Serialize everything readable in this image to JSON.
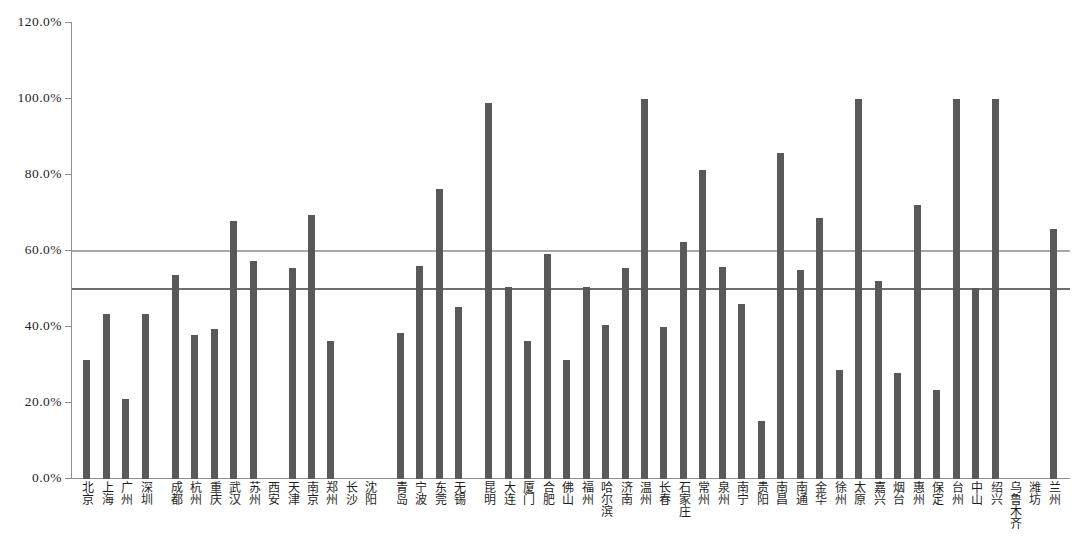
{
  "chart_data": {
    "type": "bar",
    "title": "",
    "subtitle": "",
    "xlabel": "",
    "ylabel": "",
    "ylim": [
      0,
      120
    ],
    "ytick_labels": [
      "0.0%",
      "20.0%",
      "40.0%",
      "60.0%",
      "80.0%",
      "100.0%",
      "120.0%"
    ],
    "ytick_values": [
      0,
      20,
      40,
      60,
      80,
      100,
      120
    ],
    "grid": false,
    "legend": "none",
    "reference_lines": [
      {
        "name": "upper-reference-line",
        "value": 60,
        "color": "#a8a8a8"
      },
      {
        "name": "lower-reference-line",
        "value": 50,
        "color": "#6f6f6f"
      }
    ],
    "bar_color": "#595959",
    "categories": [
      "北京",
      "上海",
      "广州",
      "深圳",
      "成都",
      "杭州",
      "重庆",
      "武汉",
      "苏州",
      "西安",
      "天津",
      "南京",
      "郑州",
      "长沙",
      "沈阳",
      "青岛",
      "宁波",
      "东莞",
      "无锡",
      "昆明",
      "大连",
      "厦门",
      "合肥",
      "佛山",
      "福州",
      "哈尔滨",
      "济南",
      "温州",
      "长春",
      "石家庄",
      "常州",
      "泉州",
      "南宁",
      "贵阳",
      "南昌",
      "南通",
      "金华",
      "徐州",
      "太原",
      "嘉兴",
      "烟台",
      "惠州",
      "保定",
      "台州",
      "中山",
      "绍兴",
      "乌鲁木齐",
      "潍坊",
      "兰州"
    ],
    "values": [
      31.2,
      43.3,
      21.0,
      43.5,
      53.8,
      37.8,
      39.4,
      68.0,
      57.4,
      null,
      55.5,
      69.6,
      36.2,
      null,
      null,
      38.3,
      56.0,
      76.4,
      45.3,
      99.0,
      50.4,
      36.3,
      59.3,
      31.2,
      50.5,
      40.5,
      55.5,
      100.0,
      39.9,
      62.4,
      81.4,
      55.9,
      46.0,
      15.2,
      85.7,
      54.9,
      68.8,
      28.7,
      100.0,
      52.0,
      27.8,
      72.2,
      23.4,
      100.0,
      50.2,
      100.0,
      null,
      null,
      65.9
    ],
    "group_gaps_after": [
      3,
      14,
      18
    ]
  }
}
